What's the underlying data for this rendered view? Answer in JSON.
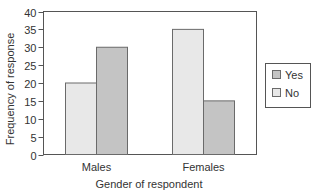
{
  "chart_data": {
    "type": "bar",
    "title": "",
    "xlabel": "Gender of respondent",
    "ylabel": "Frequency of response",
    "categories": [
      "Males",
      "Females"
    ],
    "series": [
      {
        "name": "No",
        "values": [
          20,
          35
        ],
        "color": "#e8e8e8"
      },
      {
        "name": "Yes",
        "values": [
          30,
          15
        ],
        "color": "#c4c4c4"
      }
    ],
    "ylim": [
      0,
      40
    ],
    "yticks": [
      0,
      5,
      10,
      15,
      20,
      25,
      30,
      35,
      40
    ],
    "grid": false,
    "legend": {
      "position": "right",
      "entries": [
        {
          "label": "Yes",
          "color": "#c4c4c4"
        },
        {
          "label": "No",
          "color": "#e8e8e8"
        }
      ]
    }
  },
  "colors": {
    "axis": "#555555",
    "bar_stroke": "#6a6a6a",
    "text": "#333333"
  }
}
